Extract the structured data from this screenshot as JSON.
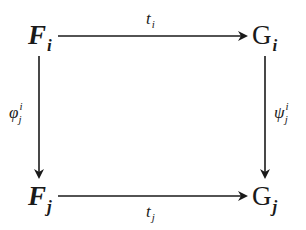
{
  "diagram": {
    "type": "commutative-square",
    "nodes": {
      "top_left": {
        "base": "F",
        "sub": "i"
      },
      "top_right": {
        "base": "G",
        "sub": "i"
      },
      "bottom_left": {
        "base": "F",
        "sub": "j"
      },
      "bottom_right": {
        "base": "G",
        "sub": "j"
      }
    },
    "arrows": {
      "top": {
        "from": "F_i",
        "to": "G_i",
        "label_base": "t",
        "label_sub": "i"
      },
      "bottom": {
        "from": "F_j",
        "to": "G_j",
        "label_base": "t",
        "label_sub": "j"
      },
      "left": {
        "from": "F_i",
        "to": "F_j",
        "label_base": "φ",
        "label_sup": "i",
        "label_sub": "j"
      },
      "right": {
        "from": "G_i",
        "to": "G_j",
        "label_base": "ψ",
        "label_sup": "i",
        "label_sub": "j"
      }
    },
    "stroke_color": "#1a1a1a",
    "background": "#ffffff"
  }
}
